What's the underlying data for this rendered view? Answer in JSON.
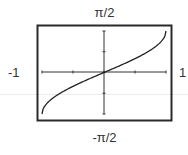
{
  "labels": {
    "top": "π/2",
    "bottom": "-π/2",
    "left": "-1",
    "right": "1"
  },
  "colors": {
    "ink": "#222222",
    "frame": "#333333",
    "background": "#ffffff"
  },
  "chart_data": {
    "type": "line",
    "title": "",
    "function": "y = arcsin(x)",
    "xlabel": "",
    "ylabel": "",
    "xlim": [
      -1,
      1
    ],
    "ylim": [
      -1.5708,
      1.5708
    ],
    "x_tick_labels": [
      "-1",
      "1"
    ],
    "y_tick_labels": [
      "-π/2",
      "π/2"
    ],
    "x_ticks": [
      -1,
      -0.5,
      0,
      0.5,
      1
    ],
    "y_ticks": [
      -1.5708,
      -0.7854,
      0,
      0.7854,
      1.5708
    ],
    "grid": false,
    "legend": null,
    "series": [
      {
        "name": "arcsin(x)",
        "x": [
          -1,
          -0.9,
          -0.75,
          -0.5,
          -0.25,
          0,
          0.25,
          0.5,
          0.75,
          0.9,
          1
        ],
        "y": [
          -1.5708,
          -1.1198,
          -0.8481,
          -0.5236,
          -0.2527,
          0,
          0.2527,
          0.5236,
          0.8481,
          1.1198,
          1.5708
        ]
      }
    ]
  }
}
